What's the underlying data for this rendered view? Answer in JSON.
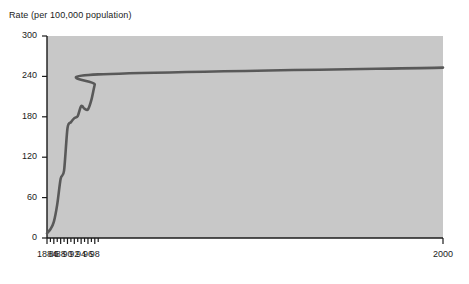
{
  "chart_data": {
    "type": "line",
    "title": "Rate (per 100,000 population)",
    "xlabel": "",
    "ylabel": "Rate (per 100,000 population)",
    "xlim": [
      1884,
      2000
    ],
    "ylim": [
      0,
      300
    ],
    "grid": false,
    "legend": null,
    "plot_background": "#c8c8c8",
    "line_color": "#595959",
    "axis_color": "#1b1b1b",
    "yticks": [
      0,
      60,
      120,
      180,
      240,
      300
    ],
    "ytick_labels": [
      "0",
      "60",
      "120",
      "180",
      "240",
      "300"
    ],
    "xticks": [
      1884,
      1886,
      1888,
      1890,
      1892,
      1894,
      1896,
      1898,
      2000
    ],
    "xtick_labels": [
      "1884",
      "86",
      "88",
      "90",
      "92",
      "94",
      "96",
      "98",
      "2000"
    ],
    "x_minor_ticks": [
      1885,
      1887,
      1889,
      1891,
      1893,
      1895,
      1897,
      1899
    ],
    "x": [
      1884,
      1885,
      1886,
      1887,
      1888,
      1889,
      1890,
      1891,
      1892,
      1893,
      1994,
      1895,
      1996,
      1997,
      1998,
      1999,
      2000
    ],
    "series": [
      {
        "name": "Rate",
        "values": [
          7,
          13,
          22,
          50,
          95,
          100,
          163,
          172,
          177,
          181,
          196,
          191,
          191,
          205,
          228,
          243,
          253
        ]
      }
    ],
    "points": [
      {
        "x": 1884,
        "y": 7
      },
      {
        "x": 1885,
        "y": 13
      },
      {
        "x": 1886,
        "y": 24
      },
      {
        "x": 1887,
        "y": 50
      },
      {
        "x": 1888,
        "y": 88
      },
      {
        "x": 1889,
        "y": 100
      },
      {
        "x": 1890,
        "y": 163
      },
      {
        "x": 1891,
        "y": 172
      },
      {
        "x": 1892,
        "y": 178
      },
      {
        "x": 1893,
        "y": 181
      },
      {
        "x": 1894,
        "y": 196
      },
      {
        "x": 1895,
        "y": 192
      },
      {
        "x": 1896,
        "y": 191
      },
      {
        "x": 1897,
        "y": 205
      },
      {
        "x": 1898,
        "y": 228
      },
      {
        "x": 1899,
        "y": 243
      },
      {
        "x": 2000,
        "y": 253
      }
    ]
  }
}
